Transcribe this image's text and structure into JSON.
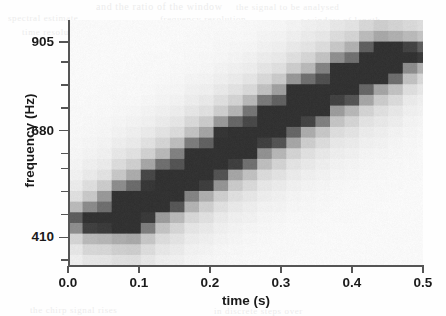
{
  "figure": {
    "kind": "spectrogram",
    "background_color": "#ffffff",
    "axis_color": "#555555",
    "text_color": "#1a1a1a"
  },
  "axes": {
    "x_title": "time (s)",
    "y_title": "frequency (Hz)",
    "x_tick_labels": [
      "0.0",
      "0.1",
      "0.2",
      "0.3",
      "0.4",
      "0.5"
    ],
    "y_tick_labels": [
      "905",
      "680",
      "410"
    ]
  },
  "scan_bleed": [
    {
      "text": "and the ratio of the window",
      "x": 96,
      "y": 1,
      "size": 10
    },
    {
      "text": "the signal to be analysed",
      "x": 236,
      "y": 2,
      "size": 9
    },
    {
      "text": "spectral estimate",
      "x": 8,
      "y": 13,
      "size": 9
    },
    {
      "text": "frequency resolution",
      "x": 160,
      "y": 14,
      "size": 9
    },
    {
      "text": "a window of length",
      "x": 300,
      "y": 15,
      "size": 9
    },
    {
      "text": "time resolution of the",
      "x": 22,
      "y": 27,
      "size": 9
    },
    {
      "text": "spectrogram is governed by",
      "x": 196,
      "y": 28,
      "size": 9
    },
    {
      "text": "the chirp signal rises",
      "x": 30,
      "y": 305,
      "size": 9
    },
    {
      "text": "in discrete steps over",
      "x": 214,
      "y": 306,
      "size": 9
    }
  ],
  "chart_data": {
    "type": "heatmap",
    "title": "",
    "xlabel": "time (s)",
    "ylabel": "frequency (Hz)",
    "xlim": [
      0.0,
      0.5
    ],
    "ylim": [
      340,
      960
    ],
    "grid": false,
    "legend": null,
    "colormap": "grayscale-reversed",
    "x_ticks": [
      0.0,
      0.1,
      0.2,
      0.3,
      0.4,
      0.5
    ],
    "y_ticks": [
      410,
      680,
      905
    ],
    "y_minor_ticks": [
      352,
      410,
      468,
      526,
      584,
      622,
      680,
      738,
      796,
      854,
      905
    ],
    "time_bin_width_s": 0.0205,
    "freq_bin_height_hz": 27,
    "steps": [
      {
        "start_s": 0.03,
        "end_s": 0.09,
        "freq_hz": 455,
        "intensity": 1.0
      },
      {
        "start_s": 0.085,
        "end_s": 0.14,
        "freq_hz": 510,
        "intensity": 0.97
      },
      {
        "start_s": 0.135,
        "end_s": 0.19,
        "freq_hz": 565,
        "intensity": 0.96
      },
      {
        "start_s": 0.185,
        "end_s": 0.24,
        "freq_hz": 620,
        "intensity": 0.95
      },
      {
        "start_s": 0.235,
        "end_s": 0.29,
        "freq_hz": 675,
        "intensity": 0.93
      },
      {
        "start_s": 0.285,
        "end_s": 0.34,
        "freq_hz": 728,
        "intensity": 0.92
      },
      {
        "start_s": 0.335,
        "end_s": 0.392,
        "freq_hz": 782,
        "intensity": 0.9
      },
      {
        "start_s": 0.388,
        "end_s": 0.443,
        "freq_hz": 832,
        "intensity": 0.88
      },
      {
        "start_s": 0.438,
        "end_s": 0.492,
        "freq_hz": 876,
        "intensity": 0.86
      }
    ],
    "sidelobe_halo_hz": 62,
    "background_noise_level": 0.05
  }
}
